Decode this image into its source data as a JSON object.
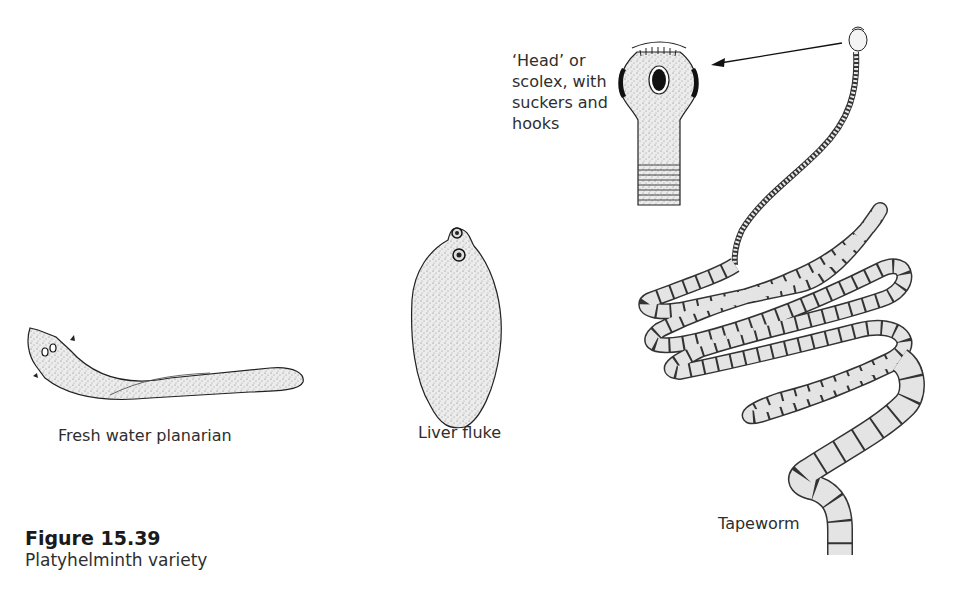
{
  "figure": {
    "number": "Figure 15.39",
    "caption": "Platyhelminth variety"
  },
  "specimens": [
    {
      "id": "planarian",
      "label": "Fresh water planarian"
    },
    {
      "id": "liver-fluke",
      "label": "Liver fluke"
    },
    {
      "id": "tapeworm",
      "label": "Tapeworm"
    }
  ],
  "callout": {
    "lines": [
      "‘Head’ or",
      "scolex, with",
      "suckers and",
      "hooks"
    ]
  },
  "colors": {
    "ink": "#1a1a1a",
    "stipple": "#9a9a9a",
    "fill": "#e6e6e6",
    "background": "#ffffff"
  }
}
